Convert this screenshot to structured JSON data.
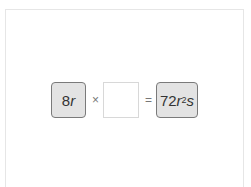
{
  "equation": {
    "left_term": {
      "coef": "8",
      "var": "r"
    },
    "operator_multiply": "×",
    "blank_answer": "",
    "operator_equals": "=",
    "right_term": {
      "coef": "72",
      "var1": "r",
      "exp": "2",
      "var2": "s"
    }
  },
  "colors": {
    "tile_bg": "#e3e3e3",
    "tile_border": "#7a7a7a",
    "blank_border": "#d8d8d8"
  }
}
